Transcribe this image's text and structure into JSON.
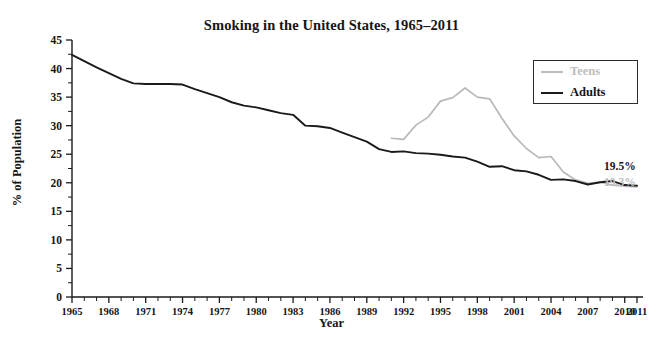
{
  "chart_data": {
    "type": "line",
    "title": "Smoking in the United States, 1965–2011",
    "xlabel": "Year",
    "ylabel": "% of Population",
    "xlim": [
      1965,
      2011
    ],
    "ylim": [
      0,
      45
    ],
    "grid": false,
    "legend_position": "top-right",
    "y_ticks": [
      0,
      5,
      10,
      15,
      20,
      25,
      30,
      35,
      40,
      45
    ],
    "y_minor_step": 2.5,
    "x_ticks": [
      1965,
      1968,
      1971,
      1974,
      1977,
      1980,
      1983,
      1986,
      1989,
      1992,
      1995,
      1998,
      2001,
      2004,
      2007,
      2010,
      2011
    ],
    "x_tick_step_minor": 1,
    "colors": {
      "adults": "#1a1a1a",
      "teens": "#bdbdbd"
    },
    "series": [
      {
        "name": "Teens",
        "color": "#bdbdbd",
        "end_label": "19.3%",
        "x": [
          1991,
          1992,
          1993,
          1994,
          1995,
          1996,
          1997,
          1998,
          1999,
          2000,
          2001,
          2002,
          2003,
          2004,
          2005,
          2006,
          2007,
          2008,
          2009,
          2010,
          2011
        ],
        "values": [
          27.8,
          27.6,
          30.1,
          31.5,
          34.3,
          34.9,
          36.6,
          35.0,
          34.7,
          31.3,
          28.2,
          26.0,
          24.4,
          24.6,
          21.9,
          20.5,
          19.9,
          20.1,
          19.6,
          19.4,
          19.3
        ]
      },
      {
        "name": "Adults",
        "color": "#1a1a1a",
        "end_label": "19.5%",
        "x": [
          1965,
          1966,
          1967,
          1968,
          1969,
          1970,
          1971,
          1972,
          1973,
          1974,
          1975,
          1976,
          1977,
          1978,
          1979,
          1980,
          1981,
          1982,
          1983,
          1984,
          1985,
          1986,
          1987,
          1988,
          1989,
          1990,
          1991,
          1992,
          1993,
          1994,
          1995,
          1996,
          1997,
          1998,
          1999,
          2000,
          2001,
          2002,
          2003,
          2004,
          2005,
          2006,
          2007,
          2008,
          2009,
          2010,
          2011
        ],
        "values": [
          42.4,
          41.3,
          40.2,
          39.2,
          38.2,
          37.4,
          37.3,
          37.3,
          37.3,
          37.2,
          36.4,
          35.7,
          35.0,
          34.1,
          33.5,
          33.2,
          32.7,
          32.2,
          31.9,
          30.0,
          29.9,
          29.6,
          28.8,
          28.0,
          27.2,
          25.9,
          25.4,
          25.5,
          25.2,
          25.1,
          24.9,
          24.6,
          24.4,
          23.7,
          22.8,
          22.9,
          22.2,
          22.0,
          21.4,
          20.5,
          20.6,
          20.3,
          19.7,
          20.1,
          20.3,
          19.6,
          19.5
        ]
      }
    ]
  },
  "chart": {
    "title": "Smoking in the United States, 1965–2011",
    "xlabel": "Year",
    "ylabel": "% of Population"
  },
  "legend": {
    "items": [
      {
        "label": "Teens"
      },
      {
        "label": "Adults"
      }
    ]
  },
  "end_labels": {
    "adults": "19.5%",
    "teens": "19.3%"
  }
}
